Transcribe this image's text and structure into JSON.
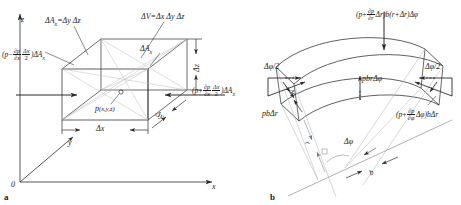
{
  "figure": {
    "caption_a": "a",
    "caption_b": "b",
    "stroke_color": "#2b2b2b",
    "light_stroke_color": "#9aa0a6",
    "background": "#ffffff"
  },
  "panel_a": {
    "name": "cartesian-fluid-element",
    "axes": {
      "origin_label": "0",
      "x_label": "x",
      "y_label": "y",
      "z_label": "z"
    },
    "labels": {
      "area_x_definition": "ΔA",
      "area_x_definition_sub": "x",
      "area_x_definition_rhs": "=Δy Δz",
      "volume_definition": "ΔV=Δx Δy Δz",
      "area_face": "ΔA",
      "area_face_sub": "x",
      "point_label": "p",
      "point_coords": "(x,y,z)",
      "dim_x": "Δx",
      "dim_y": "Δy",
      "dim_z": "Δz"
    },
    "force_left": {
      "open_paren": "(",
      "p": "p",
      "minus": "−",
      "deriv_num": "∂p",
      "deriv_den": "∂x",
      "step_num": "Δx",
      "step_den": "2",
      "close_paren": ")",
      "area": "ΔA",
      "area_sub": "x"
    },
    "force_right": {
      "open_paren": "(",
      "p": "p",
      "plus": "+",
      "deriv_num": "∂p",
      "deriv_den": "∂x",
      "step_num": "Δx",
      "step_den": "2",
      "close_paren": ")",
      "area": "ΔA",
      "area_sub": "x"
    }
  },
  "panel_b": {
    "name": "cylindrical-fluid-element",
    "force_top": {
      "open_paren": "(",
      "p": "p",
      "plus": "+",
      "deriv_num": "∂p",
      "deriv_den": "∂r",
      "dr": "Δr",
      "close_paren": ")",
      "tail": "b(r+Δr)Δφ"
    },
    "force_bottom_right": {
      "open_paren": "(",
      "p": "p",
      "plus": "+",
      "deriv_num": "∂p",
      "deriv_den": "∂φ",
      "dphi": "Δφ",
      "close_paren": ")",
      "tail": "bΔr"
    },
    "labels": {
      "force_left_face": "pbΔr",
      "force_inner_face": "pbrΔφ",
      "half_angle_left": "Δφ/2",
      "half_angle_right": "Δφ/2",
      "delta_r": "Δr",
      "delta_phi": "Δφ",
      "radius": "r",
      "width": "b"
    }
  }
}
